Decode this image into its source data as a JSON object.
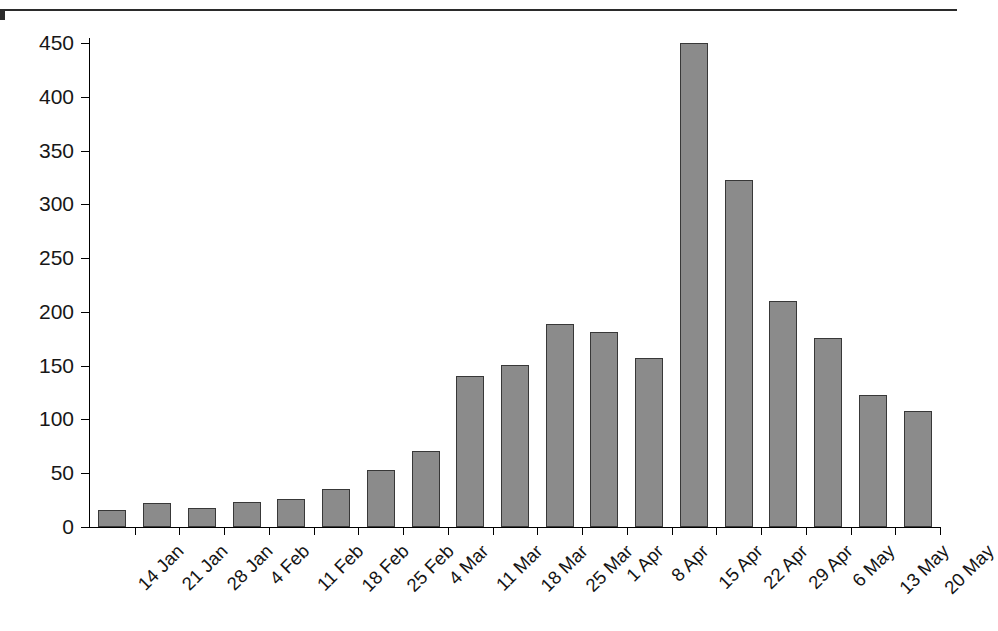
{
  "title": {
    "text_fragment_visible": "(cut off at top of image)",
    "note": "Only the descenders of the title line are visible above the horizontal rule."
  },
  "chart_data": {
    "type": "bar",
    "title": "",
    "xlabel": "",
    "ylabel": "",
    "ylim": [
      0,
      450
    ],
    "ytick_labels": [
      "0",
      "50",
      "100",
      "150",
      "200",
      "250",
      "300",
      "350",
      "400",
      "450"
    ],
    "ytick_values": [
      0,
      50,
      100,
      150,
      200,
      250,
      300,
      350,
      400,
      450
    ],
    "grid": false,
    "legend": null,
    "bar_color": "#8b8b8b",
    "bar_border_color": "#383838",
    "categories": [
      "14 Jan",
      "21 Jan",
      "28 Jan",
      "4 Feb",
      "11 Feb",
      "18 Feb",
      "25 Feb",
      "4 Mar",
      "11 Mar",
      "18 Mar",
      "25 Mar",
      "1 Apr",
      "8 Apr",
      "15 Apr",
      "22 Apr",
      "29 Apr",
      "6 May",
      "13 May",
      "20 May"
    ],
    "values": [
      16,
      22,
      18,
      23,
      26,
      35,
      53,
      71,
      140,
      151,
      189,
      181,
      157,
      450,
      323,
      210,
      176,
      123,
      108
    ]
  }
}
